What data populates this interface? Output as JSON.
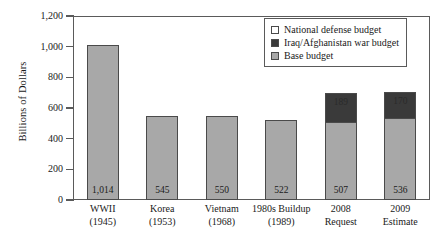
{
  "chart_data": {
    "type": "bar",
    "subtype": "stacked",
    "title": "",
    "xlabel": "",
    "ylabel": "Billions of Dollars",
    "ylim": [
      0,
      1200
    ],
    "yticks": [
      0,
      200,
      400,
      600,
      800,
      1000,
      1200
    ],
    "ytick_labels": [
      "0",
      "200",
      "400",
      "600",
      "800",
      "1,000",
      "1,200"
    ],
    "grid": false,
    "legend_position": "top-right",
    "categories": [
      "WWII (1945)",
      "Korea (1953)",
      "Vietnam (1968)",
      "1980s Buildup (1989)",
      "2008 Request",
      "2009 Estimate"
    ],
    "category_lines": [
      {
        "line1": "WWII",
        "line2": "(1945)"
      },
      {
        "line1": "Korea",
        "line2": "(1953)"
      },
      {
        "line1": "Vietnam",
        "line2": "(1968)"
      },
      {
        "line1": "1980s Buildup",
        "line2": "(1989)"
      },
      {
        "line1": "2008",
        "line2": "Request"
      },
      {
        "line1": "2009",
        "line2": "Estimate"
      }
    ],
    "series": [
      {
        "name": "Base budget",
        "color": "#a8a8a8",
        "values": [
          1014,
          545,
          550,
          522,
          507,
          536
        ],
        "labels": [
          "1,014",
          "545",
          "550",
          "522",
          "507",
          "536"
        ]
      },
      {
        "name": "Iraq/Afghanistan war budget",
        "color": "#3a3a3a",
        "values": [
          0,
          0,
          0,
          0,
          189,
          170
        ],
        "labels": [
          "",
          "",
          "",
          "",
          "189",
          "170"
        ]
      }
    ],
    "totals": [
      1014,
      545,
      550,
      522,
      696,
      706
    ],
    "legend": [
      {
        "label": "National defense budget",
        "swatch": "national",
        "color": "#ffffff"
      },
      {
        "label": "Iraq/Afghanistan war budget",
        "swatch": "war",
        "color": "#3a3a3a"
      },
      {
        "label": "Base budget",
        "swatch": "base",
        "color": "#a8a8a8"
      }
    ]
  }
}
